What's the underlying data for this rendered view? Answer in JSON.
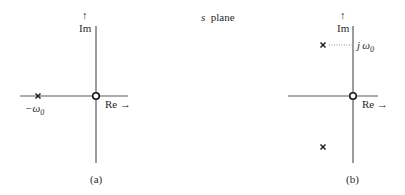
{
  "title_parts": {
    "var": "s",
    "word": "plane"
  },
  "colors": {
    "ink": "#2a2a2a",
    "axis": "#5a5a5a",
    "background": "#ffffff"
  },
  "panels": [
    {
      "id": "a",
      "caption": "(a)",
      "axes": {
        "im_label": "Im",
        "im_arrow": "↑",
        "re_label": "Re →"
      },
      "origin_marker": "zero (circle)",
      "poles": [
        {
          "label": "−ω",
          "sub": "0",
          "position": "negative real axis"
        }
      ]
    },
    {
      "id": "b",
      "caption": "(b)",
      "axes": {
        "im_label": "Im",
        "im_arrow": "↑",
        "re_label": "Re →"
      },
      "origin_marker": "zero (circle)",
      "poles": [
        {
          "position": "upper left half-plane",
          "marker": "×"
        },
        {
          "position": "lower left half-plane",
          "marker": "×"
        }
      ],
      "im_tick_label": {
        "prefix": "j",
        "sym": "ω",
        "sub": "0"
      }
    }
  ]
}
